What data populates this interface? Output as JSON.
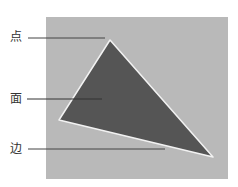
{
  "figure": {
    "labels": {
      "vertex": "点",
      "face": "面",
      "edge": "边"
    },
    "colors": {
      "background": "#b9b9b9",
      "triangle_fill": "#555555",
      "triangle_edge": "#f2f2f2",
      "leader_line": "#444444"
    },
    "triangle_vertices": [
      [
        110,
        40
      ],
      [
        59,
        120
      ],
      [
        213,
        157
      ]
    ]
  }
}
